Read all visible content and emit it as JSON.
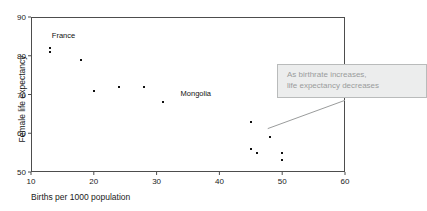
{
  "chart_data": {
    "type": "scatter",
    "title": "",
    "xlabel": "Births per 1000 population",
    "ylabel": "Female life expectancy",
    "xlim": [
      10,
      60
    ],
    "ylim": [
      50,
      90
    ],
    "xticks": [
      10,
      20,
      30,
      40,
      50,
      60
    ],
    "yticks": [
      50,
      60,
      70,
      80,
      90
    ],
    "grid": false,
    "legend": null,
    "points": [
      {
        "x": 13,
        "y": 82,
        "label": ""
      },
      {
        "x": 13,
        "y": 81,
        "label": "France"
      },
      {
        "x": 18,
        "y": 79,
        "label": ""
      },
      {
        "x": 20,
        "y": 71,
        "label": ""
      },
      {
        "x": 24,
        "y": 72,
        "label": ""
      },
      {
        "x": 28,
        "y": 72,
        "label": ""
      },
      {
        "x": 31,
        "y": 68,
        "label": "Mongolia"
      },
      {
        "x": 45,
        "y": 63,
        "label": ""
      },
      {
        "x": 48,
        "y": 59,
        "label": ""
      },
      {
        "x": 45,
        "y": 56,
        "label": ""
      },
      {
        "x": 46,
        "y": 55,
        "label": ""
      },
      {
        "x": 50,
        "y": 55,
        "label": ""
      },
      {
        "x": 50,
        "y": 53,
        "label": ""
      }
    ],
    "point_labels": [
      {
        "text": "France",
        "x": 13,
        "y": 84.5
      },
      {
        "text": "Mongolia",
        "x": 33.5,
        "y": 69.5
      }
    ],
    "annotations": [
      {
        "lines": [
          "As birthrate increases,",
          "life expectancy decreases"
        ],
        "leader_from": {
          "x": 47.7,
          "y": 61.2
        },
        "leader_to": {
          "x": 60,
          "y": 68.5
        }
      }
    ]
  },
  "colors": {
    "point": "#111111",
    "frame": "#4d4d4d",
    "callout_bg": "#eceded",
    "callout_border": "#b9bbbb",
    "callout_text": "#9a9c9c",
    "background": "#ffffff"
  }
}
